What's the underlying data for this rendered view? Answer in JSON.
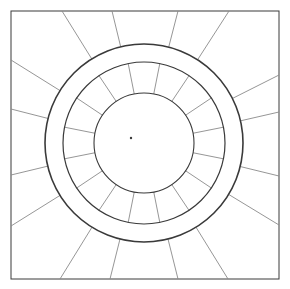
{
  "figure": {
    "stroke_color": "#3a3a3a",
    "light_stroke_color": "#8a8a8a",
    "background": "#ffffff",
    "frame": {
      "x": 11,
      "y": 11,
      "w": 268,
      "h": 268
    },
    "center": {
      "x": 144,
      "y": 143
    },
    "circles": {
      "outer_ring_r": 99,
      "inner_ring_r": 81,
      "core_r": 50
    },
    "center_dot": {
      "x": 131,
      "y": 138
    },
    "outer_rays": [
      [
        62,
        11
      ],
      [
        112,
        11
      ],
      [
        178,
        11
      ],
      [
        229,
        11
      ],
      [
        279,
        75
      ],
      [
        279,
        112
      ],
      [
        279,
        176
      ],
      [
        279,
        225
      ],
      [
        228,
        279
      ],
      [
        178,
        279
      ],
      [
        110,
        279
      ],
      [
        60,
        279
      ],
      [
        11,
        226
      ],
      [
        11,
        175
      ],
      [
        11,
        109
      ],
      [
        11,
        60
      ]
    ],
    "inner_spoke_angles_deg": [
      0,
      22.5,
      45,
      67.5,
      90,
      112.5,
      135,
      157.5,
      180,
      202.5,
      225,
      247.5,
      270,
      292.5,
      315,
      337.5
    ]
  }
}
